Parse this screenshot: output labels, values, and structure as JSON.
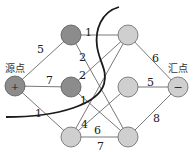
{
  "diagram": {
    "type": "flow-network-min-cut",
    "source": {
      "label": "源点",
      "symbol": "+"
    },
    "sink": {
      "label": "汇点",
      "symbol": "−"
    },
    "nodes": [
      {
        "id": "s",
        "x": 15,
        "y": 86,
        "shade": "dark"
      },
      {
        "id": "a",
        "x": 71,
        "y": 35,
        "shade": "dark"
      },
      {
        "id": "b",
        "x": 71,
        "y": 87,
        "shade": "dark"
      },
      {
        "id": "c",
        "x": 71,
        "y": 137,
        "shade": "light"
      },
      {
        "id": "d",
        "x": 128,
        "y": 35,
        "shade": "light"
      },
      {
        "id": "e",
        "x": 128,
        "y": 87,
        "shade": "light"
      },
      {
        "id": "f",
        "x": 128,
        "y": 137,
        "shade": "light"
      },
      {
        "id": "t",
        "x": 178,
        "y": 87,
        "shade": "light"
      }
    ],
    "edges": [
      {
        "from": "s",
        "to": "a",
        "weight": "5"
      },
      {
        "from": "s",
        "to": "b",
        "weight": "7"
      },
      {
        "from": "s",
        "to": "c",
        "weight": "1"
      },
      {
        "from": "a",
        "to": "d",
        "weight": "1"
      },
      {
        "from": "a",
        "to": "f",
        "weight": "2"
      },
      {
        "from": "b",
        "to": "d",
        "weight": "2"
      },
      {
        "from": "b",
        "to": "f",
        "weight": "1"
      },
      {
        "from": "c",
        "to": "d",
        "weight": "4"
      },
      {
        "from": "c",
        "to": "e",
        "weight": "6"
      },
      {
        "from": "c",
        "to": "f",
        "weight": "7"
      },
      {
        "from": "d",
        "to": "t",
        "weight": "6"
      },
      {
        "from": "e",
        "to": "t",
        "weight": "5"
      },
      {
        "from": "f",
        "to": "t",
        "weight": "8"
      }
    ],
    "colors": {
      "dark_node": "#8c8c8c",
      "light_node": "#cfcfcf",
      "cut_line": "#1a1a1a"
    }
  }
}
